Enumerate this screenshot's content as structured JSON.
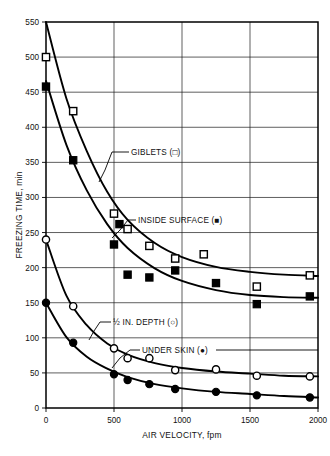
{
  "chart_data": {
    "type": "scatter",
    "title": "",
    "xlabel": "AIR VELOCITY, fpm",
    "ylabel": "FREEZING TIME, min",
    "xlim": [
      0,
      2000
    ],
    "ylim": [
      0,
      550
    ],
    "xticks": [
      0,
      500,
      1000,
      1500,
      2000
    ],
    "yticks": [
      0,
      50,
      100,
      150,
      200,
      250,
      300,
      350,
      400,
      450,
      500,
      550
    ],
    "xtick_labels": [
      "0",
      "500",
      "1000",
      "1500",
      "2000"
    ],
    "ytick_labels": [
      "0",
      "50",
      "100",
      "150",
      "200",
      "250",
      "300",
      "350",
      "400",
      "450",
      "500",
      "550"
    ],
    "grid": true,
    "legend_position": "inline-annotations",
    "series": [
      {
        "name": "GIBLETS",
        "marker": "open-square",
        "label": "GIBLETS  (□)",
        "points": [
          {
            "x": 0,
            "y": 500
          },
          {
            "x": 200,
            "y": 423
          },
          {
            "x": 500,
            "y": 277
          },
          {
            "x": 600,
            "y": 255
          },
          {
            "x": 760,
            "y": 231
          },
          {
            "x": 950,
            "y": 213
          },
          {
            "x": 1160,
            "y": 219
          },
          {
            "x": 1550,
            "y": 173
          },
          {
            "x": 1940,
            "y": 189
          }
        ],
        "curve": [
          {
            "x": 0,
            "y": 551
          },
          {
            "x": 150,
            "y": 441
          },
          {
            "x": 300,
            "y": 366
          },
          {
            "x": 450,
            "y": 308
          },
          {
            "x": 600,
            "y": 268
          },
          {
            "x": 800,
            "y": 235
          },
          {
            "x": 1000,
            "y": 215
          },
          {
            "x": 1250,
            "y": 201
          },
          {
            "x": 1500,
            "y": 194
          },
          {
            "x": 1750,
            "y": 190
          },
          {
            "x": 2000,
            "y": 188
          }
        ]
      },
      {
        "name": "INSIDE SURFACE",
        "marker": "filled-square",
        "label": "INSIDE SURFACE  (■)",
        "points": [
          {
            "x": 0,
            "y": 458
          },
          {
            "x": 200,
            "y": 353
          },
          {
            "x": 500,
            "y": 233
          },
          {
            "x": 540,
            "y": 262
          },
          {
            "x": 600,
            "y": 190
          },
          {
            "x": 760,
            "y": 186
          },
          {
            "x": 950,
            "y": 196
          },
          {
            "x": 1250,
            "y": 178
          },
          {
            "x": 1550,
            "y": 148
          },
          {
            "x": 1940,
            "y": 159
          }
        ],
        "curve": [
          {
            "x": 0,
            "y": 466
          },
          {
            "x": 150,
            "y": 375
          },
          {
            "x": 300,
            "y": 310
          },
          {
            "x": 450,
            "y": 262
          },
          {
            "x": 600,
            "y": 228
          },
          {
            "x": 800,
            "y": 199
          },
          {
            "x": 1000,
            "y": 181
          },
          {
            "x": 1250,
            "y": 168
          },
          {
            "x": 1500,
            "y": 161
          },
          {
            "x": 1750,
            "y": 158
          },
          {
            "x": 2000,
            "y": 157
          }
        ]
      },
      {
        "name": "1/2 IN. DEPTH",
        "marker": "open-circle",
        "label": "½ IN. DEPTH (○)",
        "points": [
          {
            "x": 0,
            "y": 240
          },
          {
            "x": 200,
            "y": 145
          },
          {
            "x": 500,
            "y": 85
          },
          {
            "x": 600,
            "y": 71
          },
          {
            "x": 760,
            "y": 71
          },
          {
            "x": 950,
            "y": 54
          },
          {
            "x": 1250,
            "y": 55
          },
          {
            "x": 1550,
            "y": 46
          },
          {
            "x": 1940,
            "y": 45
          }
        ],
        "curve": [
          {
            "x": 0,
            "y": 240
          },
          {
            "x": 150,
            "y": 160
          },
          {
            "x": 300,
            "y": 118
          },
          {
            "x": 450,
            "y": 92
          },
          {
            "x": 600,
            "y": 76
          },
          {
            "x": 800,
            "y": 64
          },
          {
            "x": 1000,
            "y": 57
          },
          {
            "x": 1250,
            "y": 52
          },
          {
            "x": 1500,
            "y": 49
          },
          {
            "x": 1750,
            "y": 46
          },
          {
            "x": 2000,
            "y": 45
          }
        ]
      },
      {
        "name": "UNDER SKIN",
        "marker": "filled-circle",
        "label": "UNDER SKIN (●)",
        "points": [
          {
            "x": 0,
            "y": 150
          },
          {
            "x": 200,
            "y": 93
          },
          {
            "x": 500,
            "y": 48
          },
          {
            "x": 600,
            "y": 40
          },
          {
            "x": 760,
            "y": 34
          },
          {
            "x": 950,
            "y": 27
          },
          {
            "x": 1250,
            "y": 23
          },
          {
            "x": 1550,
            "y": 18
          },
          {
            "x": 1940,
            "y": 15
          }
        ],
        "curve": [
          {
            "x": 0,
            "y": 150
          },
          {
            "x": 150,
            "y": 101
          },
          {
            "x": 300,
            "y": 73
          },
          {
            "x": 450,
            "y": 56
          },
          {
            "x": 600,
            "y": 44
          },
          {
            "x": 800,
            "y": 34
          },
          {
            "x": 1000,
            "y": 28
          },
          {
            "x": 1250,
            "y": 23
          },
          {
            "x": 1500,
            "y": 20
          },
          {
            "x": 1750,
            "y": 17
          },
          {
            "x": 2000,
            "y": 15
          }
        ]
      }
    ],
    "annotations": [
      {
        "id": "giblets",
        "text": "GIBLETS  (□)"
      },
      {
        "id": "inside_surface",
        "text": "INSIDE SURFACE  (■)"
      },
      {
        "id": "half_in_depth",
        "text": "½ IN. DEPTH (○)"
      },
      {
        "id": "under_skin",
        "text": "UNDER SKIN (●)"
      }
    ]
  },
  "axes": {
    "y_title": "FREEZING TIME, min",
    "x_title": "AIR VELOCITY, fpm"
  }
}
